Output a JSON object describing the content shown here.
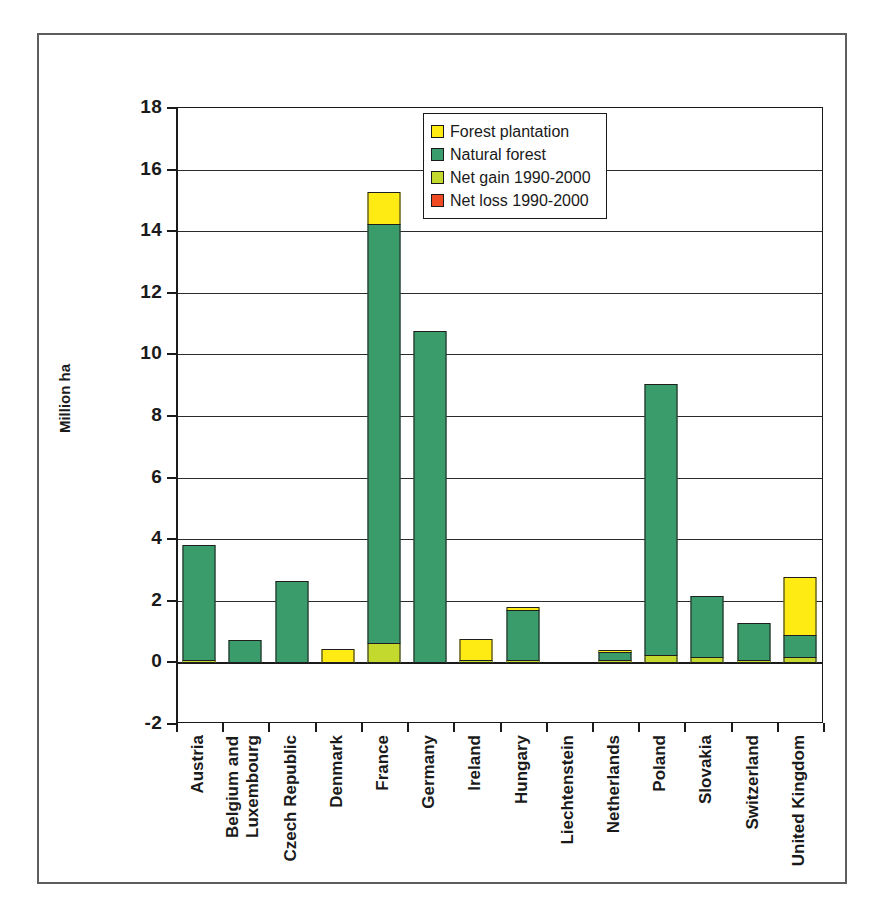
{
  "chart_data": {
    "type": "bar",
    "stacked": true,
    "title": "",
    "xlabel": "",
    "ylabel": "Million ha",
    "ylim": [
      -2,
      18
    ],
    "yticks": [
      18,
      16,
      14,
      12,
      10,
      8,
      6,
      4,
      2,
      0,
      -2
    ],
    "grid": true,
    "legend_position": "top-center",
    "categories": [
      "Austria",
      "Belgium and\nLuxembourg",
      "Czech Republic",
      "Denmark",
      "France",
      "Germany",
      "Ireland",
      "Hungary",
      "Liechtenstein",
      "Netherlands",
      "Poland",
      "Slovakia",
      "Switzerland",
      "United Kingdom"
    ],
    "series": [
      {
        "name": "Forest plantation",
        "color": "#ffeb14",
        "values": [
          0.0,
          0.0,
          0.0,
          0.45,
          1.05,
          0.0,
          0.72,
          0.15,
          0.0,
          0.08,
          0.0,
          0.0,
          0.0,
          1.9
        ]
      },
      {
        "name": "Natural forest",
        "color": "#3a9c6a",
        "values": [
          3.78,
          0.74,
          2.65,
          0.0,
          13.65,
          10.77,
          0.0,
          1.65,
          0.0,
          0.3,
          8.85,
          2.0,
          1.25,
          0.75
        ]
      },
      {
        "name": "Net gain 1990-2000",
        "color": "#c3d92e",
        "values": [
          0.1,
          0.0,
          0.0,
          0.0,
          0.65,
          0.0,
          0.08,
          0.1,
          0.0,
          0.04,
          0.25,
          0.2,
          0.05,
          0.2
        ]
      },
      {
        "name": "Net loss 1990-2000",
        "color": "#ef4a21",
        "values": [
          0,
          0,
          0,
          0,
          0,
          0,
          0,
          0,
          0,
          0,
          0,
          0,
          0,
          0
        ]
      }
    ],
    "totals": [
      3.88,
      0.74,
      2.65,
      0.45,
      15.35,
      10.77,
      0.8,
      1.9,
      0.0,
      0.42,
      9.1,
      2.2,
      1.3,
      2.85
    ]
  },
  "legend": {
    "entries": [
      {
        "label": "Forest plantation",
        "color": "#ffeb14"
      },
      {
        "label": "Natural forest",
        "color": "#3a9c6a"
      },
      {
        "label": "Net gain 1990-2000",
        "color": "#c3d92e"
      },
      {
        "label": "Net loss 1990-2000",
        "color": "#ef4a21"
      }
    ]
  }
}
